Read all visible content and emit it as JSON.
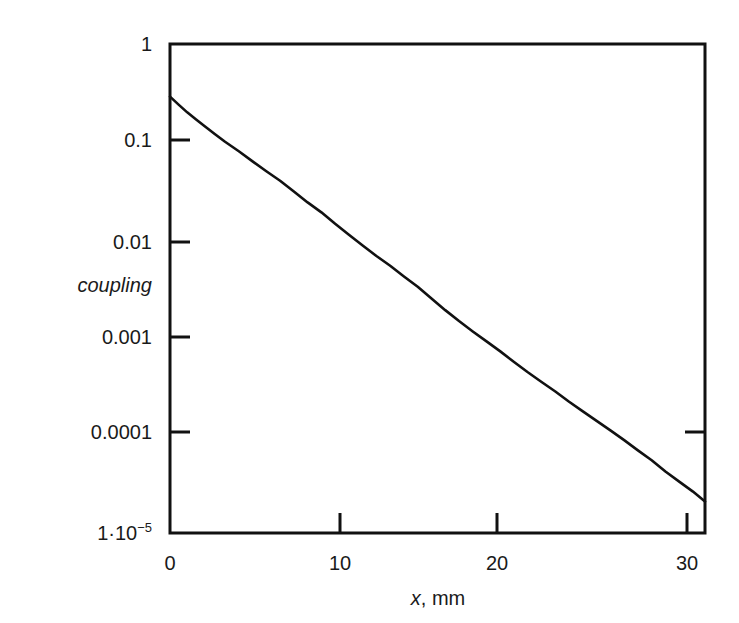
{
  "chart_data": {
    "type": "line",
    "title": "",
    "subtitle": "",
    "xlabel": "x, mm",
    "ylabel": "coupling",
    "xscale": "linear",
    "yscale": "log",
    "xlim": [
      0,
      31.1
    ],
    "ylim": [
      1e-05,
      1
    ],
    "grid": false,
    "legend": null,
    "xticks": [
      0,
      10,
      20,
      30
    ],
    "xticklabels": [
      "0",
      "10",
      "20",
      "30"
    ],
    "yticks": [
      1,
      0.1,
      0.01,
      0.001,
      0.0001,
      1e-05
    ],
    "yticklabels": [
      "1",
      "0.1",
      "0.01",
      "0.001",
      "0.0001",
      "1·10−5"
    ],
    "series": [
      {
        "name": "coupling",
        "x": [
          0.0,
          0.5,
          1.0,
          1.5,
          2.0,
          2.6,
          3.2,
          4.0,
          4.8,
          5.6,
          6.4,
          7.2,
          8.0,
          8.8,
          9.6,
          10.4,
          11.2,
          12.0,
          12.8,
          13.6,
          14.4,
          15.2,
          16.0,
          16.8,
          17.6,
          18.4,
          19.2,
          20.0,
          20.8,
          21.6,
          22.4,
          23.2,
          24.0,
          24.8,
          25.6,
          26.4,
          27.2,
          28.0,
          28.8,
          29.6,
          30.4,
          31.1
        ],
        "y": [
          0.29,
          0.24,
          0.2,
          0.17,
          0.145,
          0.12,
          0.1,
          0.08,
          0.063,
          0.05,
          0.04,
          0.031,
          0.024,
          0.019,
          0.0145,
          0.0112,
          0.0087,
          0.0068,
          0.0054,
          0.0042,
          0.0033,
          0.0025,
          0.0019,
          0.00147,
          0.00115,
          0.00091,
          0.00072,
          0.00056,
          0.00044,
          0.00035,
          0.00028,
          0.00022,
          0.000175,
          0.00014,
          0.000112,
          8.9e-05,
          7e-05,
          5.55e-05,
          4.25e-05,
          3.35e-05,
          2.65e-05,
          2.1e-05
        ]
      }
    ],
    "line_color": "#111111",
    "line_width": 2.6,
    "background_color": "#ffffff",
    "axis_color": "#111111"
  },
  "axis_titles": {
    "y": "coupling",
    "x_var": "x",
    "x_rest": ", mm"
  },
  "y_labels": {
    "l1": "1",
    "l2": "0.1",
    "l3": "0.01",
    "l4": "0.001",
    "l5": "0.0001",
    "l6_mantissa": "1",
    "l6_dot": "·",
    "l6_base": "10",
    "l6_exp": "−5"
  },
  "x_labels": {
    "t0": "0",
    "t10": "10",
    "t20": "20",
    "t30": "30"
  }
}
